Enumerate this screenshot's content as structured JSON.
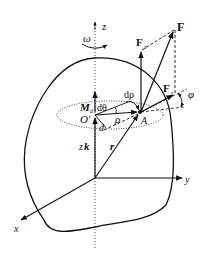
{
  "diagram": {
    "type": "3D rotating body force decomposition",
    "axes": {
      "x": "x",
      "y": "y",
      "z": "z"
    },
    "labels": {
      "omega": "ω",
      "force": "F",
      "force_z": "F",
      "force_z_sub": "z",
      "force_r": "F",
      "force_r_sub": "r",
      "phi": "φ",
      "d_rho": "dρ",
      "d_theta": "dθ",
      "moment": "M",
      "moment_sub": "d",
      "o_prime": "O'",
      "point_a": "A",
      "d": "d",
      "rho": "ρ",
      "zk_z": "z",
      "zk_k": "k",
      "r": "r"
    },
    "colors": {
      "stroke": "#111111",
      "background": "#ffffff"
    }
  }
}
